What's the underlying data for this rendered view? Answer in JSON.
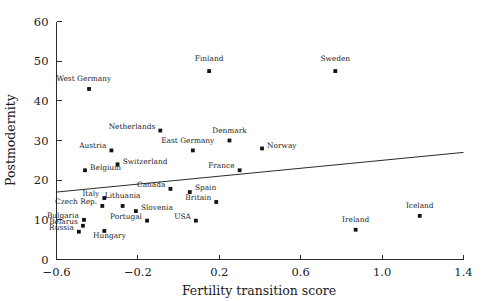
{
  "chart_data": {
    "type": "scatter",
    "title": "",
    "xlabel": "Fertility transition score",
    "ylabel": "Postmodernity",
    "xlim": [
      -0.6,
      1.4
    ],
    "ylim": [
      0,
      60
    ],
    "xticks": [
      "-0.6",
      "-0.2",
      "0.2",
      "0.6",
      "1.0",
      "1.4"
    ],
    "xtick_values": [
      -0.6,
      -0.2,
      0.2,
      0.6,
      1.0,
      1.4
    ],
    "yticks": [
      "0",
      "10",
      "20",
      "30",
      "40",
      "50",
      "60"
    ],
    "ytick_values": [
      0,
      10,
      20,
      30,
      40,
      50,
      60
    ],
    "grid": false,
    "legend": "none",
    "marker_color": "#141414",
    "line_color": "#2b2b2b",
    "points": [
      {
        "label": "West Germany",
        "x": -0.44,
        "y": 43.0,
        "lx": -0.6,
        "ly": 45.0,
        "anchor": "start"
      },
      {
        "label": "Finland",
        "x": 0.15,
        "y": 47.5,
        "lx": 0.15,
        "ly": 50.0,
        "anchor": "middle"
      },
      {
        "label": "Sweden",
        "x": 0.77,
        "y": 47.5,
        "lx": 0.77,
        "ly": 50.0,
        "anchor": "middle"
      },
      {
        "label": "Netherlands",
        "x": -0.09,
        "y": 32.5,
        "lx": -0.115,
        "ly": 33.0,
        "anchor": "end"
      },
      {
        "label": "Denmark",
        "x": 0.25,
        "y": 30.0,
        "lx": 0.25,
        "ly": 32.0,
        "anchor": "middle"
      },
      {
        "label": "East Germany",
        "x": 0.07,
        "y": 27.5,
        "lx": 0.045,
        "ly": 29.3,
        "anchor": "middle"
      },
      {
        "label": "Norway",
        "x": 0.41,
        "y": 28.0,
        "lx": 0.435,
        "ly": 28.0,
        "anchor": "start"
      },
      {
        "label": "Austria",
        "x": -0.33,
        "y": 27.5,
        "lx": -0.355,
        "ly": 28.0,
        "anchor": "end"
      },
      {
        "label": "Switzerland",
        "x": -0.3,
        "y": 24.0,
        "lx": -0.275,
        "ly": 24.0,
        "anchor": "start"
      },
      {
        "label": "France",
        "x": 0.3,
        "y": 22.5,
        "lx": 0.275,
        "ly": 23.0,
        "anchor": "end"
      },
      {
        "label": "Belgium",
        "x": -0.46,
        "y": 22.5,
        "lx": -0.435,
        "ly": 22.5,
        "anchor": "start"
      },
      {
        "label": "Canada",
        "x": -0.04,
        "y": 17.8,
        "lx": -0.065,
        "ly": 18.3,
        "anchor": "end"
      },
      {
        "label": "Spain",
        "x": 0.055,
        "y": 17.0,
        "lx": 0.08,
        "ly": 17.5,
        "anchor": "start"
      },
      {
        "label": "Italy",
        "x": -0.365,
        "y": 15.5,
        "lx": -0.39,
        "ly": 16.0,
        "anchor": "end"
      },
      {
        "label": "Britain",
        "x": 0.185,
        "y": 14.5,
        "lx": 0.16,
        "ly": 15.0,
        "anchor": "end"
      },
      {
        "label": "Lithuania",
        "x": -0.275,
        "y": 13.5,
        "lx": -0.275,
        "ly": 15.5,
        "anchor": "middle"
      },
      {
        "label": "Czech Rep.",
        "x": -0.375,
        "y": 13.5,
        "lx": -0.4,
        "ly": 14.0,
        "anchor": "end"
      },
      {
        "label": "Slovenia",
        "x": -0.21,
        "y": 12.2,
        "lx": -0.185,
        "ly": 12.4,
        "anchor": "start"
      },
      {
        "label": "Bulgaria",
        "x": -0.465,
        "y": 10.0,
        "lx": -0.49,
        "ly": 10.4,
        "anchor": "end"
      },
      {
        "label": "Portugal",
        "x": -0.155,
        "y": 9.8,
        "lx": -0.18,
        "ly": 10.2,
        "anchor": "end"
      },
      {
        "label": "USA",
        "x": 0.085,
        "y": 9.8,
        "lx": 0.06,
        "ly": 10.2,
        "anchor": "end"
      },
      {
        "label": "Belarus",
        "x": -0.47,
        "y": 8.5,
        "lx": -0.495,
        "ly": 8.9,
        "anchor": "end"
      },
      {
        "label": "Russia",
        "x": -0.49,
        "y": 7.0,
        "lx": -0.515,
        "ly": 7.4,
        "anchor": "end"
      },
      {
        "label": "Hungary",
        "x": -0.365,
        "y": 7.2,
        "lx": -0.34,
        "ly": 5.3,
        "anchor": "middle"
      },
      {
        "label": "Ireland",
        "x": 0.87,
        "y": 7.5,
        "lx": 0.87,
        "ly": 9.5,
        "anchor": "middle"
      },
      {
        "label": "Iceland",
        "x": 1.185,
        "y": 11.0,
        "lx": 1.185,
        "ly": 13.0,
        "anchor": "middle"
      }
    ],
    "fit_line": {
      "x_start": -0.6,
      "y_start": 17.0,
      "x_end": 1.4,
      "y_end": 27.0
    }
  }
}
